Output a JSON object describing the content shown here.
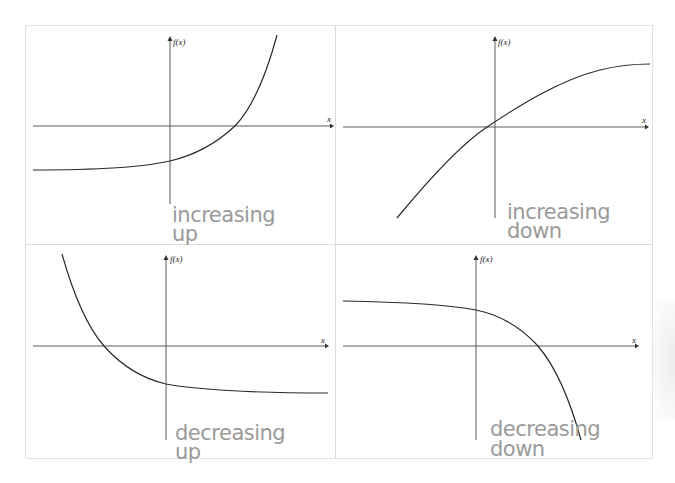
{
  "panels": [
    {
      "id": "top-left",
      "y_axis_label": "f(x)",
      "x_axis_label": "x",
      "note_line1": "increasing",
      "note_line2": "up",
      "description": "Exponential growth curve: rises slowly from left asymptote below x-axis, crosses x-axis right of origin, curves steeply upward"
    },
    {
      "id": "top-right",
      "y_axis_label": "f(x)",
      "x_axis_label": "x",
      "note_line1": "increasing",
      "note_line2": "down",
      "description": "Concave-down increasing curve (logarithmic-like), passes near origin, levels off toward top right"
    },
    {
      "id": "bottom-left",
      "y_axis_label": "f(x)",
      "x_axis_label": "x",
      "note_line1": "decreasing",
      "note_line2": "up",
      "description": "Exponential decay curve: steep descent from top left, crosses x-axis left of origin, levels off below x-axis"
    },
    {
      "id": "bottom-right",
      "y_axis_label": "f(x)",
      "x_axis_label": "x",
      "note_line1": "decreasing",
      "note_line2": "down",
      "description": "Concave-down decreasing curve: nearly flat above x-axis on left, crosses x-axis right of origin, plunges steeply downward"
    }
  ],
  "colors": {
    "axis": "#5a5a5a",
    "curve": "#2a2a2a",
    "handwriting": "#9a9a9a",
    "border": "#dcdcdc"
  }
}
